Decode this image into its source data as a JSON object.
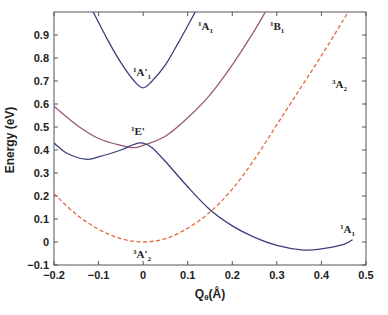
{
  "chart_data": {
    "type": "line",
    "title": "",
    "xlabel": "Qθ(Å)",
    "ylabel": "Energy (eV)",
    "xlim": [
      -0.2,
      0.5
    ],
    "ylim": [
      -0.1,
      1.0
    ],
    "grid": false,
    "legend": "none (curves labeled inline)",
    "x_ticks": [
      "-0.2",
      "-0.1",
      "0",
      "0.1",
      "0.2",
      "0.3",
      "0.4",
      "0.5"
    ],
    "y_ticks": [
      "-0.1",
      "0",
      "0.1",
      "0.2",
      "0.3",
      "0.4",
      "0.5",
      "0.6",
      "0.7",
      "0.8",
      "0.9"
    ],
    "series": [
      {
        "name": "1A'1 / 1A1 (upper)",
        "color": "#3b3f7a",
        "style": "solid",
        "x": [
          -0.112,
          -0.08,
          -0.05,
          -0.02,
          0.0,
          0.02,
          0.05,
          0.08,
          0.117
        ],
        "y": [
          1.0,
          0.88,
          0.78,
          0.7,
          0.67,
          0.7,
          0.77,
          0.87,
          1.0
        ]
      },
      {
        "name": "1B1",
        "color": "#9a5a7a",
        "style": "solid",
        "x": [
          -0.2,
          -0.15,
          -0.1,
          -0.05,
          -0.02,
          0.0,
          0.05,
          0.1,
          0.15,
          0.2,
          0.25,
          0.274
        ],
        "y": [
          0.59,
          0.51,
          0.45,
          0.42,
          0.41,
          0.42,
          0.46,
          0.54,
          0.64,
          0.77,
          0.92,
          1.0
        ]
      },
      {
        "name": "1E' / 1A1 (lower)",
        "color": "#3b3f7a",
        "style": "solid",
        "x": [
          -0.2,
          -0.17,
          -0.13,
          -0.1,
          -0.05,
          -0.02,
          0.0,
          0.02,
          0.05,
          0.1,
          0.15,
          0.2,
          0.25,
          0.3,
          0.36,
          0.4,
          0.45,
          0.47
        ],
        "y": [
          0.43,
          0.385,
          0.36,
          0.37,
          0.4,
          0.425,
          0.43,
          0.41,
          0.35,
          0.24,
          0.14,
          0.07,
          0.02,
          -0.015,
          -0.035,
          -0.03,
          -0.01,
          0.01
        ]
      },
      {
        "name": "3A'2 / 3A2",
        "color": "#e8663a",
        "style": "dashed",
        "x": [
          -0.2,
          -0.15,
          -0.1,
          -0.05,
          0.0,
          0.05,
          0.1,
          0.15,
          0.2,
          0.25,
          0.3,
          0.35,
          0.4,
          0.46
        ],
        "y": [
          0.21,
          0.12,
          0.055,
          0.015,
          0.0,
          0.015,
          0.06,
          0.13,
          0.23,
          0.36,
          0.51,
          0.66,
          0.81,
          1.0
        ]
      }
    ],
    "annotations": [
      {
        "text": "1A1",
        "x": 0.19,
        "y": 0.93
      },
      {
        "text": "1B1",
        "x": 0.295,
        "y": 0.93
      },
      {
        "text": "1A'1",
        "x": -0.03,
        "y": 0.72
      },
      {
        "text": "1E'",
        "x": -0.03,
        "y": 0.46
      },
      {
        "text": "3A2",
        "x": 0.4,
        "y": 0.65
      },
      {
        "text": "3A'2",
        "x": -0.02,
        "y": -0.11
      },
      {
        "text": "1A1",
        "x": 0.44,
        "y": 0.05
      }
    ]
  },
  "labels": {
    "ylabel": "Energy (eV)",
    "xlabel_main": "Q",
    "xlabel_sub": "θ",
    "xlabel_unit": "(Å)",
    "a1_upper_sup": "1",
    "a1_upper_main": "A",
    "a1_upper_sub": "1",
    "b1_sup": "1",
    "b1_main": "B",
    "b1_sub": "1",
    "a1p_sup": "1",
    "a1p_main": "A'",
    "a1p_sub": "1",
    "ep_sup": "1",
    "ep_main": "E'",
    "a2_sup": "3",
    "a2_main": "A",
    "a2_sub": "2",
    "a2p_sup": "3",
    "a2p_main": "A'",
    "a2p_sub": "2",
    "a1_lower_sup": "1",
    "a1_lower_main": "A",
    "a1_lower_sub": "1"
  }
}
